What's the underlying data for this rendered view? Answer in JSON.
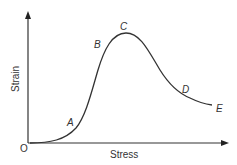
{
  "diagram": {
    "title": "",
    "origin_label": "O",
    "xlabel": "Stress",
    "ylabel": "Strain",
    "points": [
      {
        "label": "A"
      },
      {
        "label": "B"
      },
      {
        "label": "C"
      },
      {
        "label": "D"
      },
      {
        "label": "E"
      }
    ],
    "colors": {
      "line": "#333333",
      "axis": "#333333"
    }
  }
}
